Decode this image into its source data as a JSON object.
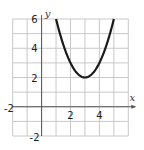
{
  "chart_data": {
    "type": "line",
    "title": "",
    "xlabel": "x",
    "ylabel": "y",
    "xlim": [
      -2,
      6
    ],
    "ylim": [
      -2,
      6
    ],
    "grid": true,
    "grid_step": 1,
    "function": "y = (x - 3)^2 + 2",
    "vertex": [
      3,
      2
    ],
    "x_tick_labels": [
      "-2",
      "2",
      "4"
    ],
    "y_tick_labels": [
      "6",
      "4",
      "2",
      "-2"
    ],
    "series": [
      {
        "name": "parabola",
        "x": [
          1,
          1.5,
          2,
          2.5,
          3,
          3.5,
          4,
          4.5,
          5
        ],
        "y": [
          6,
          4.25,
          3,
          2.25,
          2,
          2.25,
          3,
          4.25,
          6
        ]
      }
    ]
  },
  "labels": {
    "x_axis": "x",
    "y_axis": "y",
    "x_ticks": [
      {
        "text": "-2",
        "value": -2
      },
      {
        "text": "2",
        "value": 2
      },
      {
        "text": "4",
        "value": 4
      }
    ],
    "y_ticks": [
      {
        "text": "6",
        "value": 6
      },
      {
        "text": "4",
        "value": 4
      },
      {
        "text": "2",
        "value": 2
      },
      {
        "text": "-2",
        "value": -2
      }
    ]
  },
  "colors": {
    "grid": "#c8c8c8",
    "axis": "#555555",
    "curve": "#1a1a1a"
  }
}
